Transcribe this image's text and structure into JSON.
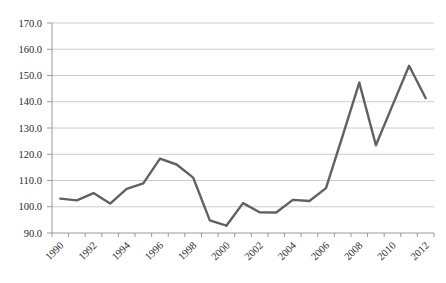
{
  "chart_data": {
    "type": "line",
    "title": "",
    "xlabel": "",
    "ylabel": "",
    "legend": "none",
    "grid": "horizontal-only",
    "x": [
      1990,
      1991,
      1992,
      1993,
      1994,
      1995,
      1996,
      1997,
      1998,
      1999,
      2000,
      2001,
      2002,
      2003,
      2004,
      2005,
      2006,
      2007,
      2008,
      2009,
      2010,
      2011,
      2012
    ],
    "series": [
      {
        "name": "value-index",
        "values": [
          103.1,
          102.4,
          105.2,
          101.2,
          106.8,
          108.9,
          118.3,
          116.1,
          111.1,
          94.8,
          92.8,
          101.4,
          97.9,
          97.8,
          102.6,
          102.2,
          107.1,
          127.1,
          147.3,
          123.4,
          138.6,
          153.7,
          141.3
        ]
      }
    ],
    "ylim": [
      90,
      170
    ],
    "ytick_step": 10,
    "ytick_labels": [
      "90.0",
      "100.0",
      "110.0",
      "120.0",
      "130.0",
      "140.0",
      "150.0",
      "160.0",
      "170.0"
    ],
    "xtick_labels": [
      "1990",
      "1992",
      "1994",
      "1996",
      "1998",
      "2000",
      "2002",
      "2004",
      "2006",
      "2008",
      "2010",
      "2012"
    ],
    "xtick_label_every": 2,
    "x_label_rotation_deg": -45,
    "colors": {
      "series_line": "#616161",
      "gridline": "#c6c6c6",
      "axis": "#9a9a9a",
      "tick": "#9a9a9a",
      "label_text": "#2b2b2b",
      "background": "#ffffff"
    }
  }
}
